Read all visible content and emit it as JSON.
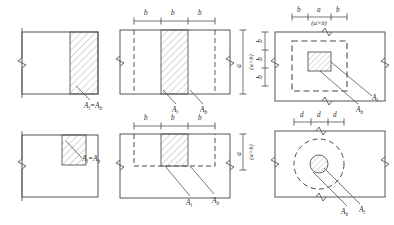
{
  "figure": {
    "type": "engineering-cross-section-diagram",
    "line_color": "#555555",
    "hatch_color": "#8a8a8a",
    "dash_color": "#4a4a4a",
    "panels": [
      {
        "id": "top-left",
        "shape": "square-edge-strip",
        "hatch": "right-edge-band",
        "label": "A",
        "label_sub": "l",
        "label_eq": "=A",
        "label_eq_sub": "b",
        "label_full": "A_l=A_b",
        "break_marks": [
          "left-edge"
        ]
      },
      {
        "id": "top-middle",
        "shape": "wide-strip-centered",
        "hatch": "center-band",
        "dim_top": [
          "b",
          "b",
          "b"
        ],
        "dim_right_value": "a",
        "dim_right_cond": "(a>b)",
        "leader_labels": [
          {
            "text": "A",
            "sub": "l"
          },
          {
            "text": "A",
            "sub": "b"
          }
        ],
        "break_marks": [
          "left-edge",
          "right-edge"
        ]
      },
      {
        "id": "top-right",
        "shape": "rect-with-dashed-square",
        "hatch": "center-rect",
        "dim_top": [
          "b",
          "a",
          "b"
        ],
        "dim_top_cond": "(a>b)",
        "dim_left": [
          "b",
          "b",
          "b"
        ],
        "leader_labels": [
          {
            "text": "A",
            "sub": "l"
          },
          {
            "text": "A",
            "sub": "b"
          }
        ],
        "break_marks": [
          "left-edge",
          "right-edge",
          "top-edge",
          "bottom-edge"
        ]
      },
      {
        "id": "bottom-left",
        "shape": "square-corner-block",
        "hatch": "top-right-corner",
        "label": "A",
        "label_sub": "l",
        "label_eq": "=A",
        "label_eq_sub": "b",
        "label_full": "A_l=A_b",
        "break_marks": [
          "left-edge"
        ]
      },
      {
        "id": "bottom-middle",
        "shape": "wide-strip-half-dashed",
        "hatch": "center-band",
        "dim_top": [
          "b",
          "b",
          "b"
        ],
        "dim_right_value": "a",
        "dim_right_cond": "(a>b)",
        "leader_labels": [
          {
            "text": "A",
            "sub": "l"
          },
          {
            "text": "A",
            "sub": "b"
          }
        ],
        "break_marks": [
          "left-edge",
          "right-edge"
        ]
      },
      {
        "id": "bottom-right",
        "shape": "rect-with-dashed-circle",
        "hatch": "center-circle",
        "dim_top": [
          "d",
          "d",
          "d"
        ],
        "leader_labels": [
          {
            "text": "A",
            "sub": "b"
          },
          {
            "text": "A",
            "sub": "l"
          }
        ],
        "break_marks": [
          "left-edge",
          "right-edge",
          "top-edge",
          "bottom-edge"
        ]
      }
    ]
  }
}
